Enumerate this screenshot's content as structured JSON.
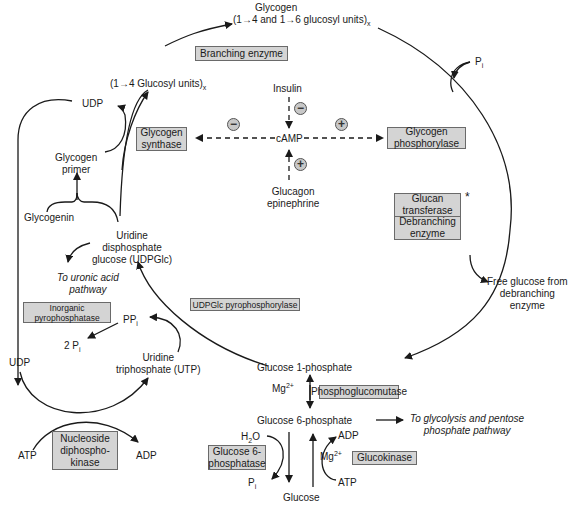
{
  "metabolites": {
    "glycogen": "Glycogen",
    "glycogen_units_pre": "(1→4 and 1→6 glucosyl units)",
    "glycogen_units_sub": "x",
    "glucosyl_14_pre": "(1→4 Glucosyl units)",
    "glucosyl_14_sub": "x",
    "udp_top": "UDP",
    "glycogen_primer_1": "Glycogen",
    "glycogen_primer_2": "primer",
    "glycogenin": "Glycogenin",
    "udpglc_1": "Uridine",
    "udpglc_2": "disphosphate",
    "udpglc_3": "glucose (UDPGlc)",
    "uronic_1": "To uronic acid",
    "uronic_2": "pathway",
    "ppi": "PP",
    "ppi_sub": "i",
    "two_pi": "2 P",
    "two_pi_sub": "i",
    "udp_left": "UDP",
    "utp_1": "Uridine",
    "utp_2": "triphosphate (UTP)",
    "atp_left": "ATP",
    "adp_left": "ADP",
    "g1p": "Glucose 1-phosphate",
    "mg1": "Mg",
    "mg1_sup": "2+",
    "g6p": "Glucose 6-phosphate",
    "glycolysis_1": "To glycolysis and pentose",
    "glycolysis_2": "phosphate pathway",
    "h2o_pre": "H",
    "h2o_sub": "2",
    "h2o_post": "O",
    "pi_bottom": "P",
    "pi_bottom_sub": "i",
    "glucose": "Glucose",
    "adp_right": "ADP",
    "atp_right": "ATP",
    "mg2": "Mg",
    "mg2_sup": "2+",
    "pi_top": "P",
    "pi_top_sub": "i",
    "free_glucose_1": "Free glucose from",
    "free_glucose_2": "debranching",
    "free_glucose_3": "enzyme"
  },
  "regulation": {
    "insulin": "Insulin",
    "camp": "cAMP",
    "glucagon_1": "Glucagon",
    "glucagon_2": "epinephrine",
    "minus_insulin": "−",
    "minus_synthase": "−",
    "plus_phosphorylase": "+",
    "plus_glucagon": "+"
  },
  "enzymes": {
    "branching": "Branching enzyme",
    "synthase_1": "Glycogen",
    "synthase_2": "synthase",
    "phosphorylase_1": "Glycogen",
    "phosphorylase_2": "phosphorylase",
    "glucan_1": "Glucan",
    "glucan_2": "transferase",
    "debranching_1": "Debranching",
    "debranching_2": "enzyme",
    "asterisk": "*",
    "udpglc_pyro": "UDPGlc pyrophosphorylase",
    "inorganic_1": "Inorganic",
    "inorganic_2": "pyrophosphatase",
    "ndk_1": "Nucleoside",
    "ndk_2": "diphospho-",
    "ndk_3": "kinase",
    "phosphoglucomutase": "Phosphoglucomutase",
    "g6pase_1": "Glucose 6-",
    "g6pase_2": "phosphatase",
    "glucokinase": "Glucokinase"
  },
  "colors": {
    "box_fill": "#d4d4d4",
    "box_border": "#6a6a6a",
    "line": "#1a1a1a"
  }
}
